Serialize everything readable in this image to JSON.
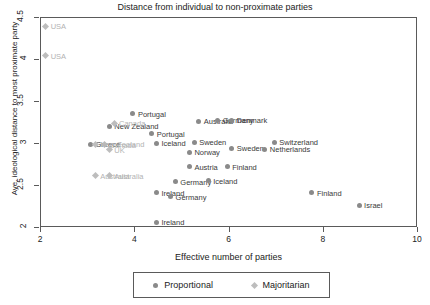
{
  "chart_data": {
    "type": "scatter",
    "title": "Distance from individual to non-proximate parties",
    "xlabel": "Effective number of parties",
    "ylabel": "Ave. ideological distance to most proximate party",
    "xlim": [
      2,
      10
    ],
    "ylim": [
      2,
      4.5
    ],
    "xticks": [
      "2",
      "4",
      "6",
      "8",
      "10"
    ],
    "yticks": [
      "2",
      "2.5",
      "3",
      "3.5",
      "4",
      "4.5"
    ],
    "grid": false,
    "legend_position": "bottom",
    "series": [
      {
        "name": "Proportional",
        "marker": "circle",
        "color": "#8a8a8a",
        "points": [
          {
            "label": "Portugal",
            "x": 3.95,
            "y": 3.36
          },
          {
            "label": "New Zealand",
            "x": 3.45,
            "y": 3.21
          },
          {
            "label": "Australia",
            "x": 5.35,
            "y": 3.27
          },
          {
            "label": "Germany",
            "x": 5.75,
            "y": 3.28
          },
          {
            "label": "Denmark",
            "x": 6.05,
            "y": 3.28
          },
          {
            "label": "Portugal",
            "x": 4.35,
            "y": 3.12
          },
          {
            "label": "Sweden",
            "x": 5.25,
            "y": 3.02
          },
          {
            "label": "Switzerland",
            "x": 6.95,
            "y": 3.02
          },
          {
            "label": "Sweden",
            "x": 6.05,
            "y": 2.95
          },
          {
            "label": "Norway",
            "x": 5.15,
            "y": 2.9
          },
          {
            "label": "Netherlands",
            "x": 6.75,
            "y": 2.94
          },
          {
            "label": "Greece",
            "x": 3.05,
            "y": 3.0
          },
          {
            "label": "Iceland",
            "x": 4.45,
            "y": 3.01
          },
          {
            "label": "Austria",
            "x": 5.15,
            "y": 2.73
          },
          {
            "label": "Finland",
            "x": 5.95,
            "y": 2.73
          },
          {
            "label": "Germany",
            "x": 4.85,
            "y": 2.55
          },
          {
            "label": "Iceland",
            "x": 5.55,
            "y": 2.56
          },
          {
            "label": "Ireland",
            "x": 4.45,
            "y": 2.42
          },
          {
            "label": "Germany",
            "x": 4.75,
            "y": 2.37
          },
          {
            "label": "Finland",
            "x": 7.75,
            "y": 2.42
          },
          {
            "label": "Israel",
            "x": 8.75,
            "y": 2.27
          },
          {
            "label": "Ireland",
            "x": 4.45,
            "y": 2.07
          }
        ]
      },
      {
        "name": "Majoritarian",
        "marker": "diamond",
        "color": "#bdbdbd",
        "points": [
          {
            "label": "USA",
            "x": 2.1,
            "y": 4.4
          },
          {
            "label": "USA",
            "x": 2.1,
            "y": 4.05
          },
          {
            "label": "Canada",
            "x": 3.55,
            "y": 3.25
          },
          {
            "label": "Canada",
            "x": 3.35,
            "y": 2.99
          },
          {
            "label": "UK",
            "x": 3.45,
            "y": 2.93
          },
          {
            "label": "New Zealand",
            "x": 3.15,
            "y": 3.0
          },
          {
            "label": "Australia",
            "x": 3.15,
            "y": 2.62
          },
          {
            "label": "Australia",
            "x": 3.45,
            "y": 2.62
          }
        ]
      }
    ]
  },
  "legend": {
    "proportional_label": "Proportional",
    "majoritarian_label": "Majoritarian"
  }
}
